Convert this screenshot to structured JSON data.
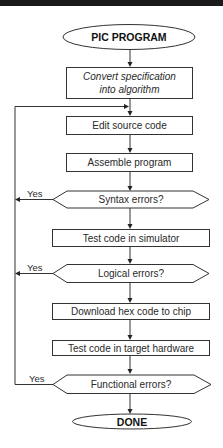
{
  "diagram": {
    "type": "flowchart",
    "start": {
      "label": "PIC PROGRAM",
      "shape": "ellipse"
    },
    "steps": [
      {
        "label_lines": [
          "Convert specification",
          "into algorithm"
        ],
        "shape": "process",
        "style": "italic"
      },
      {
        "label": "Edit source code",
        "shape": "process"
      },
      {
        "label": "Assemble program",
        "shape": "process"
      },
      {
        "label": "Syntax errors?",
        "shape": "decision",
        "yes_label": "Yes"
      },
      {
        "label": "Test code in simulator",
        "shape": "process"
      },
      {
        "label": "Logical errors?",
        "shape": "decision",
        "yes_label": "Yes"
      },
      {
        "label": "Download hex code to chip",
        "shape": "process"
      },
      {
        "label": "Test code in target hardware",
        "shape": "process"
      },
      {
        "label": "Functional errors?",
        "shape": "decision",
        "yes_label": "Yes"
      }
    ],
    "end": {
      "label": "DONE",
      "shape": "ellipse"
    },
    "loop_back_target": "Edit source code",
    "colors": {
      "stroke": "#333333",
      "fill": "#ffffff",
      "top_bar": "#1a1a1a"
    }
  }
}
